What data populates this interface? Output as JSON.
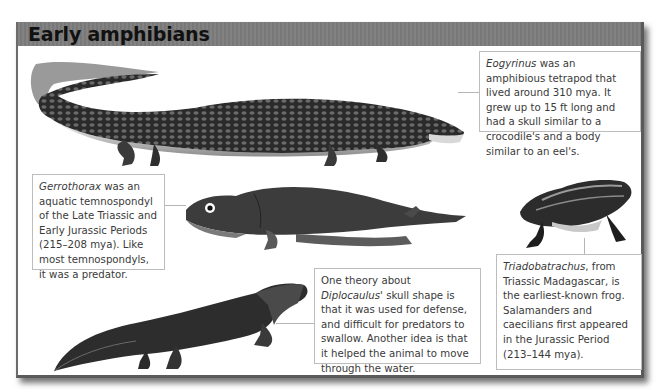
{
  "page": {
    "title": "Early amphibians"
  },
  "captions": {
    "eogyrinus": {
      "name": "Eogyrinus",
      "text": " was an amphibious tetrapod that lived around 310 mya. It grew up to 15 ft long and had a skull similar to a crocodile's and a body similar to an eel's."
    },
    "gerrothorax": {
      "name": "Gerrothorax",
      "text": " was an aquatic temnospondyl of the Late Triassic and Early Jurassic Periods (215–208 mya). Like most temnospondyls, it was a predator."
    },
    "diplocaulus": {
      "prefix": "One theory about ",
      "name": "Diplocaulus",
      "text": "' skull shape is that it was used for defense, and difficult for predators to swallow. Another idea is that it helped the animal to move through the water."
    },
    "triadobatrachus": {
      "name": "Triadobatrachus",
      "text": ", from Triassic Madagascar, is the earliest-known frog. Salamanders and caecilians first appeared in the Jurassic Period (213–144 mya)."
    }
  },
  "illustrations": [
    {
      "name": "eogyrinus",
      "icon": "eogyrinus-illustration-icon"
    },
    {
      "name": "gerrothorax",
      "icon": "gerrothorax-illustration-icon"
    },
    {
      "name": "diplocaulus",
      "icon": "diplocaulus-illustration-icon"
    },
    {
      "name": "triadobatrachus",
      "icon": "frog-illustration-icon"
    }
  ],
  "colors": {
    "header": "#7d7d7d",
    "frame": "#5a5a5a",
    "text": "#3a3a3a",
    "box_border": "#bdbdbd"
  }
}
